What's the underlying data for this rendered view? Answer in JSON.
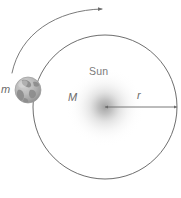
{
  "figure": {
    "width": 181,
    "height": 198,
    "background": "#ffffff"
  },
  "labels": {
    "sun": "Sun",
    "sun_mass": "M",
    "earth_mass": "m",
    "radius": "r"
  },
  "icons": {
    "earth": "earth-globe-icon",
    "sun": "sun-glow-icon",
    "orbit": "orbit-circle-icon",
    "direction": "motion-arrow-icon",
    "radius": "radius-arrow-icon"
  },
  "colors": {
    "orbit_stroke": "#5d5d5d",
    "arc_stroke": "#6b6b6b",
    "arrow_stroke": "#6a6a6a",
    "label_text": "#6e6e6e",
    "sun_glow": "#b9b9b9",
    "earth_base": "#b4b4b4",
    "earth_land": "#8e8e8e",
    "background": "#ffffff"
  },
  "geometry": {
    "orbit_center_x": 105,
    "orbit_center_y": 107,
    "orbit_radius": 72,
    "earth_center_x": 28,
    "earth_center_y": 90,
    "earth_radius": 13,
    "radius_arrow_from_x": 105,
    "radius_arrow_to_x": 177,
    "radius_arrow_y": 107
  }
}
